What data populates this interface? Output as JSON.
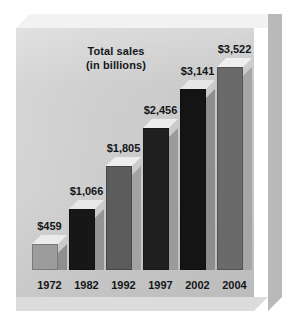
{
  "chart_data": {
    "type": "bar",
    "title": "Total sales\n(in billions)",
    "title_lines": [
      "Total sales",
      "(in billions)"
    ],
    "xlabel": "",
    "ylabel": "",
    "categories": [
      "1972",
      "1982",
      "1992",
      "1997",
      "2002",
      "2004"
    ],
    "values": [
      459,
      1066,
      1805,
      2456,
      3141,
      3522
    ],
    "value_labels": [
      "$459",
      "$1,066",
      "$1,805",
      "$2,456",
      "$3,141",
      "$3,522"
    ],
    "unit": "billions of dollars",
    "currency_symbol": "$",
    "ylim": [
      0,
      3522
    ],
    "grid": false,
    "legend": false,
    "axis_visible": false,
    "style": "3d-bar",
    "series": [
      {
        "name": "Total sales",
        "values": [
          459,
          1066,
          1805,
          2456,
          3141,
          3522
        ]
      }
    ],
    "bars": [
      {
        "category": "1972",
        "value": 459,
        "label": "$459",
        "front_color": "#9c9c9c",
        "side_color": "#8f8f8f",
        "top_color": "#ebebeb"
      },
      {
        "category": "1982",
        "value": 1066,
        "label": "$1,066",
        "front_color": "#171717",
        "side_color": "#949494",
        "top_color": "#e8e8e8"
      },
      {
        "category": "1992",
        "value": 1805,
        "label": "$1,805",
        "front_color": "#5c5c5c",
        "side_color": "#a2a2a2",
        "top_color": "#ededed"
      },
      {
        "category": "1997",
        "value": 2456,
        "label": "$2,456",
        "front_color": "#1f1f1f",
        "side_color": "#9a9a9a",
        "top_color": "#ebebeb"
      },
      {
        "category": "2002",
        "value": 3141,
        "label": "$3,141",
        "front_color": "#141414",
        "side_color": "#8d8d8d",
        "top_color": "#e6e6e6"
      },
      {
        "category": "2004",
        "value": 3522,
        "label": "$3,522",
        "front_color": "#6a6a6a",
        "side_color": "#a6a6a6",
        "top_color": "#efefef"
      }
    ]
  },
  "colors": {
    "page_background": "#ffffff",
    "plot_background": "#cdcdcd",
    "slab_top": "#f2f2f2",
    "slab_right": "#b9b9b9",
    "slab_bottom": "#dcdcdc",
    "text": "#141619"
  }
}
